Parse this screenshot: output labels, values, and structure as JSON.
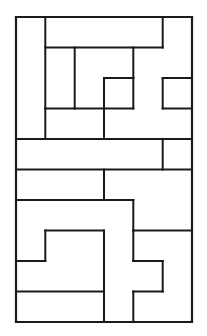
{
  "figure": {
    "style": {
      "line_color": "#1a1a1a",
      "fill_color": "#ffffff",
      "background_color": "#ffffff",
      "outer_line_width": 2.2,
      "inner_line_width": 2.0
    },
    "frame": {
      "x": 16,
      "y": 17,
      "width": 176,
      "height": 305
    },
    "grid": {
      "columns": 6,
      "rows": 10,
      "cell_width": 29.33,
      "cell_height": 30.5,
      "x_ticks": [
        16,
        45.3,
        74.7,
        104,
        133.3,
        162.7,
        192
      ],
      "y_ticks": [
        17,
        47.5,
        78,
        108.5,
        139,
        169.5,
        200,
        230.5,
        261,
        291.5,
        322
      ]
    },
    "pieces": [
      {
        "id": "piece-1",
        "name": "top-left-vertical-bar",
        "points": "16,17 45.3,17 45.3,139 16,139"
      },
      {
        "id": "piece-2",
        "name": "top-band-hook",
        "points": "45.3,17 162.7,17 162.7,47.5 74.7,47.5 74.7,108.5 45.3,108.5"
      },
      {
        "id": "piece-3",
        "name": "upper-right-corner-block",
        "points": "162.7,17 192,17 192,78 162.7,78"
      },
      {
        "id": "piece-4",
        "name": "central-zigzag-piece",
        "points": "74.7,47.5 133.3,47.5 133.3,78 104,78 104,139 74.7,139"
      },
      {
        "id": "piece-5",
        "name": "mid-right-step-piece",
        "points": "133.3,78 162.7,78 162.7,108.5 192,108.5 192,139 104,139 104,108.5 133.3,108.5"
      },
      {
        "id": "piece-6",
        "name": "lower-left-hook-upper",
        "points": "45.3,108.5 74.7,108.5 74.7,139 45.3,139"
      },
      {
        "id": "piece-7",
        "name": "full-width-horizontal-band",
        "points": "16,139 162.7,139 162.7,169.5 16,169.5"
      },
      {
        "id": "piece-8",
        "name": "band-right-cap",
        "points": "162.7,139 192,139 192,169.5 162.7,169.5"
      },
      {
        "id": "piece-9",
        "name": "lower-left-wide-bar",
        "points": "16,169.5 104,169.5 104,200 16,200"
      },
      {
        "id": "piece-10",
        "name": "lower-mid-step-piece",
        "points": "104,169.5 192,169.5 192,230.5 133.3,230.5 133.3,200 104,200"
      },
      {
        "id": "piece-11",
        "name": "left-vertical-step-piece",
        "points": "16,200 104,200 104,230.5 45.3,230.5 45.3,261 16,261"
      },
      {
        "id": "piece-12",
        "name": "bottom-left-large-L",
        "points": "16,261 45.3,261 45.3,230.5 104,230.5 104,291.5 16,291.5"
      },
      {
        "id": "piece-13",
        "name": "bottom-center-plus-piece",
        "points": "104,230.5 133.3,230.5 133.3,261 162.7,261 162.7,291.5 133.3,291.5 133.3,322 104,322"
      },
      {
        "id": "piece-14",
        "name": "bottom-right-corner-piece",
        "points": "133.3,230.5 192,230.5 192,322 133.3,322 133.3,291.5 162.7,291.5 162.7,261 133.3,261"
      }
    ],
    "segments": [
      {
        "name": "outer-frame-top",
        "x1": 16,
        "y1": 17,
        "x2": 192,
        "y2": 17
      },
      {
        "name": "outer-frame-right",
        "x1": 192,
        "y1": 17,
        "x2": 192,
        "y2": 322
      },
      {
        "name": "outer-frame-bottom",
        "x1": 192,
        "y1": 322,
        "x2": 16,
        "y2": 322
      },
      {
        "name": "outer-frame-left",
        "x1": 16,
        "y1": 322,
        "x2": 16,
        "y2": 17
      },
      {
        "name": "seg-v-col1-top",
        "x1": 45.3,
        "y1": 17,
        "x2": 45.3,
        "y2": 108.5
      },
      {
        "name": "seg-h-topband",
        "x1": 45.3,
        "y1": 47.5,
        "x2": 162.7,
        "y2": 47.5
      },
      {
        "name": "seg-v-right-upper",
        "x1": 162.7,
        "y1": 17,
        "x2": 162.7,
        "y2": 47.5
      },
      {
        "name": "seg-v-col2-upper",
        "x1": 74.7,
        "y1": 47.5,
        "x2": 74.7,
        "y2": 108.5
      },
      {
        "name": "seg-h-mid1",
        "x1": 45.3,
        "y1": 108.5,
        "x2": 74.7,
        "y2": 108.5
      },
      {
        "name": "seg-v-col1-lower",
        "x1": 45.3,
        "y1": 108.5,
        "x2": 45.3,
        "y2": 139
      },
      {
        "name": "seg-v-col4-upper",
        "x1": 133.3,
        "y1": 47.5,
        "x2": 133.3,
        "y2": 78
      },
      {
        "name": "seg-h-zig1",
        "x1": 104,
        "y1": 78,
        "x2": 133.3,
        "y2": 78
      },
      {
        "name": "seg-v-col3-mid",
        "x1": 104,
        "y1": 78,
        "x2": 104,
        "y2": 139
      },
      {
        "name": "seg-h-zig2",
        "x1": 74.7,
        "y1": 108.5,
        "x2": 104,
        "y2": 108.5
      },
      {
        "name": "seg-h-right1",
        "x1": 162.7,
        "y1": 78,
        "x2": 192,
        "y2": 78
      },
      {
        "name": "seg-v-right-mid",
        "x1": 162.7,
        "y1": 78,
        "x2": 162.7,
        "y2": 108.5
      },
      {
        "name": "seg-h-right2",
        "x1": 162.7,
        "y1": 108.5,
        "x2": 192,
        "y2": 108.5
      },
      {
        "name": "seg-v-col4-mid",
        "x1": 133.3,
        "y1": 78,
        "x2": 133.3,
        "y2": 108.5
      },
      {
        "name": "seg-h-right3",
        "x1": 104,
        "y1": 108.5,
        "x2": 133.3,
        "y2": 108.5
      },
      {
        "name": "seg-h-band-top",
        "x1": 16,
        "y1": 139,
        "x2": 162.7,
        "y2": 139
      },
      {
        "name": "seg-v-band-right",
        "x1": 162.7,
        "y1": 139,
        "x2": 162.7,
        "y2": 169.5
      },
      {
        "name": "seg-h-band-capright",
        "x1": 162.7,
        "y1": 139,
        "x2": 192,
        "y2": 139
      },
      {
        "name": "seg-h-band-bottom",
        "x1": 16,
        "y1": 169.5,
        "x2": 192,
        "y2": 169.5
      },
      {
        "name": "seg-v-col3-low",
        "x1": 104,
        "y1": 169.5,
        "x2": 104,
        "y2": 200
      },
      {
        "name": "seg-h-low1",
        "x1": 16,
        "y1": 200,
        "x2": 104,
        "y2": 200
      },
      {
        "name": "seg-h-low2",
        "x1": 104,
        "y1": 200,
        "x2": 133.3,
        "y2": 200
      },
      {
        "name": "seg-v-col4-low",
        "x1": 133.3,
        "y1": 200,
        "x2": 133.3,
        "y2": 230.5
      },
      {
        "name": "seg-h-low3",
        "x1": 133.3,
        "y1": 230.5,
        "x2": 192,
        "y2": 230.5
      },
      {
        "name": "seg-v-col1-low",
        "x1": 45.3,
        "y1": 230.5,
        "x2": 45.3,
        "y2": 261
      },
      {
        "name": "seg-h-low4",
        "x1": 45.3,
        "y1": 230.5,
        "x2": 104,
        "y2": 230.5
      },
      {
        "name": "seg-h-low5",
        "x1": 16,
        "y1": 261,
        "x2": 45.3,
        "y2": 261
      },
      {
        "name": "seg-v-col3-bottom",
        "x1": 104,
        "y1": 230.5,
        "x2": 104,
        "y2": 322
      },
      {
        "name": "seg-h-bottom1",
        "x1": 16,
        "y1": 291.5,
        "x2": 104,
        "y2": 291.5
      },
      {
        "name": "seg-v-plus-left",
        "x1": 133.3,
        "y1": 230.5,
        "x2": 133.3,
        "y2": 261
      },
      {
        "name": "seg-h-plus-top",
        "x1": 133.3,
        "y1": 261,
        "x2": 162.7,
        "y2": 261
      },
      {
        "name": "seg-v-plus-right",
        "x1": 162.7,
        "y1": 261,
        "x2": 162.7,
        "y2": 291.5
      },
      {
        "name": "seg-h-plus-bottom",
        "x1": 133.3,
        "y1": 291.5,
        "x2": 162.7,
        "y2": 291.5
      },
      {
        "name": "seg-v-plus-stem",
        "x1": 133.3,
        "y1": 291.5,
        "x2": 133.3,
        "y2": 322
      }
    ]
  }
}
